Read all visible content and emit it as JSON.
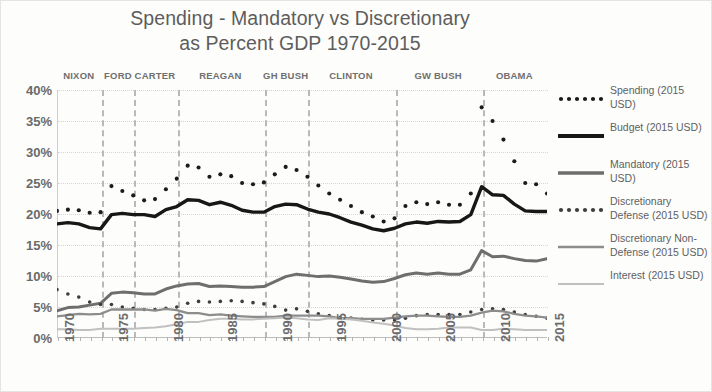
{
  "title": {
    "line1": "Spending - Mandatory vs Discretionary",
    "line2": "as Percent GDP 1970-2015"
  },
  "axes": {
    "y_ticks": [
      "0%",
      "5%",
      "10%",
      "15%",
      "20%",
      "25%",
      "30%",
      "35%",
      "40%"
    ],
    "x_ticks": [
      "1970",
      "1975",
      "1980",
      "1985",
      "1990",
      "1995",
      "2000",
      "2005",
      "2010",
      "2015"
    ]
  },
  "presidents": [
    {
      "label": "NIXON",
      "year": 1972.0
    },
    {
      "label": "FORD",
      "year": 1975.6
    },
    {
      "label": "CARTER",
      "year": 1979.0
    },
    {
      "label": "REAGAN",
      "year": 1985.0
    },
    {
      "label": "GH BUSH",
      "year": 1991.0
    },
    {
      "label": "CLINTON",
      "year": 1997.0
    },
    {
      "label": "GW BUSH",
      "year": 2005.0
    },
    {
      "label": "OBAMA",
      "year": 2012.0
    }
  ],
  "president_dividers": [
    1974,
    1977,
    1981,
    1989,
    1993,
    2001,
    2009
  ],
  "legend": [
    {
      "name": "Spending (2015 USD)",
      "style": "dotted-black",
      "color": "#1b1b1b"
    },
    {
      "name": "Budget (2015 USD)",
      "style": "solid-black",
      "color": "#171717"
    },
    {
      "name": "Mandatory (2015 USD)",
      "style": "solid-gray",
      "color": "#6e6e6e"
    },
    {
      "name": "Discretionary Defense (2015 USD)",
      "style": "dotted-gray",
      "color": "#3d3d3d"
    },
    {
      "name": "Discretionary Non-Defense (2015 USD)",
      "style": "solid-midgray",
      "color": "#8d8d8d"
    },
    {
      "name": "Interest (2015 USD)",
      "style": "solid-lightgray",
      "color": "#c0c0c0"
    }
  ],
  "colors": {
    "background": "#fdfdfc",
    "grid": "#d7d7d7",
    "divider": "#b9b9b9",
    "text": "#5f5f5f"
  },
  "chart_data": {
    "type": "line",
    "title": "Spending - Mandatory vs Discretionary as Percent GDP 1970-2015",
    "xlabel": "",
    "ylabel": "Percent GDP",
    "xlim": [
      1970,
      2015
    ],
    "ylim": [
      0,
      40
    ],
    "grid": true,
    "legend_position": "right",
    "x": [
      1970,
      1971,
      1972,
      1973,
      1974,
      1975,
      1976,
      1977,
      1978,
      1979,
      1980,
      1981,
      1982,
      1983,
      1984,
      1985,
      1986,
      1987,
      1988,
      1989,
      1990,
      1991,
      1992,
      1993,
      1994,
      1995,
      1996,
      1997,
      1998,
      1999,
      2000,
      2001,
      2002,
      2003,
      2004,
      2005,
      2006,
      2007,
      2008,
      2009,
      2010,
      2011,
      2012,
      2013,
      2014,
      2015
    ],
    "series": [
      {
        "name": "Spending (2015 USD)",
        "style": "dotted",
        "color": "#1b1b1b",
        "values": [
          20.5,
          20.7,
          20.6,
          20.2,
          20.3,
          24.5,
          23.7,
          23.0,
          22.2,
          22.4,
          24.0,
          25.7,
          27.8,
          27.5,
          26.0,
          26.4,
          26.1,
          25.0,
          24.8,
          25.1,
          26.4,
          27.6,
          27.1,
          26.0,
          24.6,
          23.3,
          22.3,
          21.3,
          20.3,
          19.6,
          18.8,
          19.3,
          21.3,
          21.9,
          21.6,
          21.9,
          21.5,
          21.5,
          23.3,
          37.2,
          35.0,
          32.0,
          28.5,
          25.0,
          24.8,
          23.3
        ]
      },
      {
        "name": "Budget (2015 USD)",
        "style": "solid",
        "color": "#171717",
        "values": [
          18.4,
          18.6,
          18.4,
          17.8,
          17.6,
          19.9,
          20.1,
          19.9,
          19.9,
          19.6,
          20.7,
          21.2,
          22.3,
          22.2,
          21.5,
          21.9,
          21.4,
          20.6,
          20.3,
          20.3,
          21.2,
          21.6,
          21.5,
          20.8,
          20.3,
          20.0,
          19.4,
          18.7,
          18.2,
          17.6,
          17.3,
          17.7,
          18.4,
          18.7,
          18.5,
          18.8,
          18.7,
          18.8,
          19.9,
          24.4,
          23.1,
          23.0,
          21.6,
          20.5,
          20.4,
          20.4
        ]
      },
      {
        "name": "Mandatory (2015 USD)",
        "style": "solid",
        "color": "#6e6e6e",
        "values": [
          4.4,
          4.9,
          5.0,
          5.3,
          5.6,
          7.2,
          7.4,
          7.3,
          7.1,
          7.1,
          7.9,
          8.4,
          8.7,
          8.8,
          8.3,
          8.4,
          8.3,
          8.2,
          8.2,
          8.3,
          9.1,
          9.9,
          10.3,
          10.1,
          9.9,
          10.0,
          9.8,
          9.5,
          9.2,
          9.0,
          9.1,
          9.6,
          10.2,
          10.5,
          10.3,
          10.5,
          10.3,
          10.3,
          11.0,
          14.1,
          13.1,
          13.2,
          12.8,
          12.5,
          12.4,
          12.8
        ]
      },
      {
        "name": "Discretionary Defense (2015 USD)",
        "style": "dotted",
        "color": "#3d3d3d",
        "values": [
          7.8,
          7.1,
          6.6,
          5.8,
          5.4,
          5.4,
          5.0,
          4.8,
          4.6,
          4.6,
          4.8,
          5.0,
          5.6,
          5.9,
          5.8,
          5.9,
          6.0,
          5.9,
          5.7,
          5.5,
          5.1,
          4.5,
          4.7,
          4.3,
          3.9,
          3.6,
          3.3,
          3.2,
          3.0,
          2.9,
          2.9,
          2.9,
          3.2,
          3.6,
          3.8,
          3.8,
          3.8,
          3.8,
          4.2,
          4.6,
          4.7,
          4.6,
          4.2,
          3.8,
          3.5,
          3.2
        ]
      },
      {
        "name": "Discretionary Non-Defense (2015 USD)",
        "style": "solid",
        "color": "#8d8d8d",
        "values": [
          3.5,
          3.7,
          3.9,
          3.8,
          3.9,
          4.6,
          4.6,
          4.6,
          4.6,
          4.4,
          4.7,
          4.5,
          4.0,
          4.0,
          3.7,
          3.8,
          3.6,
          3.5,
          3.4,
          3.4,
          3.4,
          3.6,
          3.6,
          3.6,
          3.6,
          3.5,
          3.2,
          3.2,
          3.1,
          3.1,
          3.1,
          3.3,
          3.5,
          3.6,
          3.6,
          3.5,
          3.4,
          3.4,
          3.6,
          4.1,
          4.4,
          4.3,
          3.9,
          3.6,
          3.5,
          3.3
        ]
      },
      {
        "name": "Interest (2015 USD)",
        "style": "solid",
        "color": "#c0c0c0",
        "values": [
          1.4,
          1.4,
          1.3,
          1.3,
          1.5,
          1.5,
          1.5,
          1.5,
          1.6,
          1.7,
          1.9,
          2.2,
          2.6,
          2.6,
          2.9,
          3.1,
          3.1,
          3.0,
          3.0,
          3.1,
          3.2,
          3.3,
          3.2,
          3.0,
          2.9,
          3.2,
          3.1,
          3.0,
          2.8,
          2.5,
          2.3,
          2.0,
          1.6,
          1.4,
          1.4,
          1.5,
          1.7,
          1.7,
          1.7,
          1.3,
          1.3,
          1.5,
          1.4,
          1.3,
          1.3,
          1.3
        ]
      }
    ]
  }
}
